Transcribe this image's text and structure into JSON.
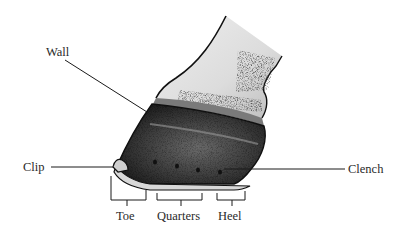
{
  "diagram": {
    "labels": {
      "wall": "Wall",
      "clip": "Clip",
      "clench": "Clench",
      "toe": "Toe",
      "quarters": "Quarters",
      "heel": "Heel"
    },
    "colors": {
      "ink": "#1a1a1a",
      "text": "#2a2a2a",
      "hoof_dark": "#222222",
      "skin_light": "#e6e6e6",
      "shoe": "#d8d8d8",
      "background": "#ffffff"
    }
  }
}
